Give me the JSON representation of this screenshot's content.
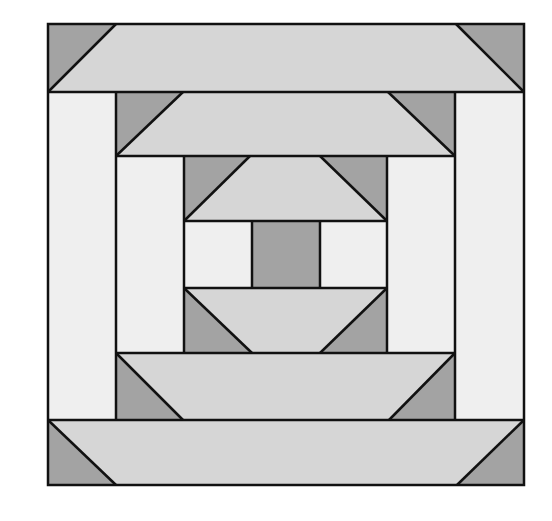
{
  "diagram": {
    "type": "quilt-block",
    "colors": {
      "background": "#ffffff",
      "dark": "#a3a3a3",
      "light": "#d6d6d6",
      "pale": "#efefef",
      "outline": "#111111"
    },
    "bounds": {
      "left": 48,
      "top": 24,
      "right": 524,
      "bottom": 485
    },
    "rings": [
      {
        "name": "outer",
        "left": 48,
        "right": 524,
        "top_band": [
          24,
          92
        ],
        "bottom_band": [
          420,
          485
        ]
      },
      {
        "name": "middle",
        "left": 116,
        "right": 455,
        "top_band": [
          92,
          156
        ],
        "bottom_band": [
          353,
          420
        ]
      },
      {
        "name": "inner",
        "left": 184,
        "right": 387,
        "top_band": [
          156,
          221
        ],
        "bottom_band": [
          288,
          353
        ]
      }
    ],
    "center": {
      "square": {
        "left": 252,
        "right": 320,
        "top": 221,
        "bottom": 288
      }
    }
  }
}
